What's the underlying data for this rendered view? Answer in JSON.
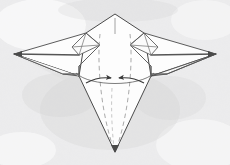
{
  "figure": {
    "title": "Origami paper airplane folding step diagram",
    "caption": "Two curved arrows point inward toward the vertical center line, indicating the lower flaps are folded in toward the middle.",
    "background_color": "#f0f0f0",
    "paper_fill": "#fdfdfd",
    "edge_color": "#4a4a4a",
    "crease_color": "#8c8c8c",
    "arrow_color": "#3a3a3a",
    "shading_color": "#d7d7d7",
    "width": 230,
    "height": 165
  },
  "parts": [
    {
      "id": "nose-top",
      "label": "Top nose point",
      "kind": "vertex"
    },
    {
      "id": "left-wing",
      "label": "Left wing",
      "kind": "panel"
    },
    {
      "id": "right-wing",
      "label": "Right wing",
      "kind": "panel"
    },
    {
      "id": "left-wing-tip",
      "label": "Left wing tip",
      "kind": "vertex"
    },
    {
      "id": "right-wing-tip",
      "label": "Right wing tip",
      "kind": "vertex"
    },
    {
      "id": "body-panel",
      "label": "Center body panel",
      "kind": "panel"
    },
    {
      "id": "tail-point",
      "label": "Bottom tail point",
      "kind": "vertex"
    },
    {
      "id": "left-flap",
      "label": "Left wing root flap",
      "kind": "panel"
    },
    {
      "id": "right-flap",
      "label": "Right wing root flap",
      "kind": "panel"
    },
    {
      "id": "left-crease",
      "label": "Left valley crease",
      "kind": "dashed-crease"
    },
    {
      "id": "right-crease",
      "label": "Right valley crease",
      "kind": "dashed-crease"
    },
    {
      "id": "center-crease",
      "label": "Center crease at nose",
      "kind": "crease"
    },
    {
      "id": "fold-guide-arc",
      "label": "Fold guide arc",
      "kind": "guide"
    }
  ],
  "arrows": [
    {
      "id": "arrow-left",
      "label": "Fold left flap inward",
      "direction": "right"
    },
    {
      "id": "arrow-right",
      "label": "Fold right flap inward",
      "direction": "left"
    }
  ],
  "geometry": {
    "nose_top": [
      115,
      14
    ],
    "tail_point": [
      115,
      152
    ],
    "left_wing_tip": [
      14,
      54
    ],
    "right_wing_tip": [
      216,
      54
    ],
    "left_shoulder": [
      86,
      33
    ],
    "right_shoulder": [
      144,
      33
    ],
    "left_body": [
      79,
      76
    ],
    "right_body": [
      151,
      76
    ],
    "arrow_meet": [
      115,
      81
    ]
  }
}
